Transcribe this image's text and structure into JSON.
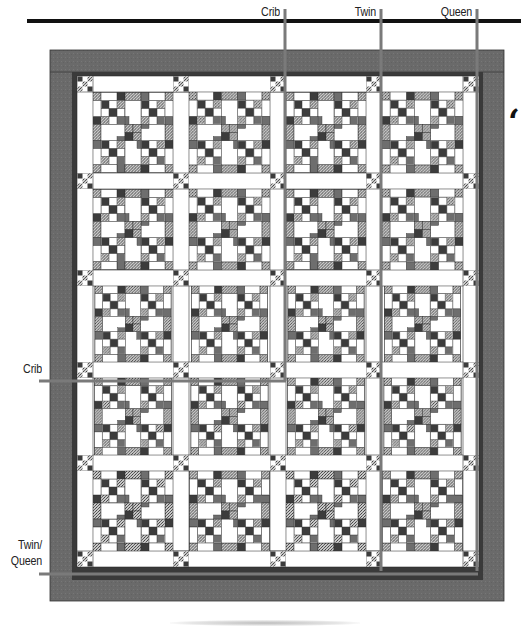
{
  "figure": {
    "size_labels": {
      "top": [
        {
          "text": "Crib",
          "x": 285
        },
        {
          "text": "Twin",
          "x": 381
        },
        {
          "text": "Queen",
          "x": 477
        }
      ],
      "left": [
        {
          "text": "Crib",
          "y": 381
        },
        {
          "line1": "Twin/",
          "line2": "Queen",
          "y": 576
        }
      ]
    },
    "layout": {
      "block_columns": 4,
      "block_rows": 5,
      "total_blocks": 20,
      "sashing": "white strips with nine-patch cornerstones",
      "inner_border": "narrow dark",
      "outer_border": "wide gray"
    },
    "colors": {
      "outer_border": "#6b6b6b",
      "inner_border": "#3a3a3a",
      "cut_line": "#7a7a7a",
      "background": "#ffffff",
      "dark_square": "#3c3c3c",
      "mid_square": "#6e6e6e",
      "print_square": "#9a9a9a",
      "outline": "#333333",
      "rule": "#111111"
    },
    "edge_glyph": "‘"
  }
}
